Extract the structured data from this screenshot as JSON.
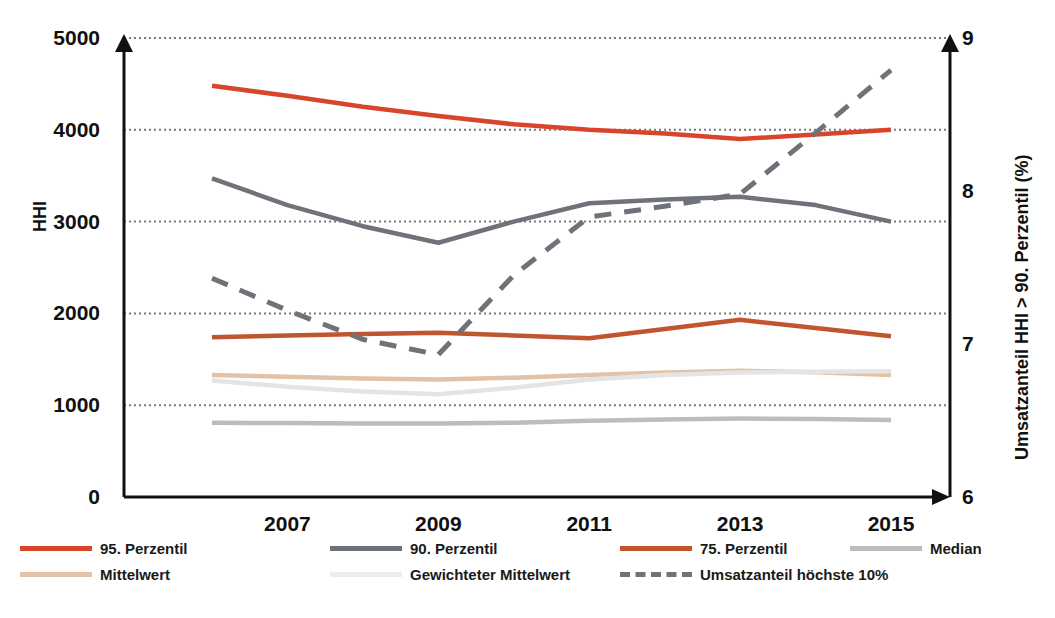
{
  "chart_data": {
    "type": "line",
    "title": "",
    "xlabel": "",
    "ylabel": "HHI",
    "y2label": "Umsatzanteil HHI > 90. Perzentil (%)",
    "grid": true,
    "legend_position": "bottom",
    "x": [
      2006,
      2007,
      2008,
      2009,
      2010,
      2011,
      2012,
      2013,
      2014,
      2015
    ],
    "xticks": [
      "2007",
      "2009",
      "2011",
      "2013",
      "2015"
    ],
    "xtick_values": [
      2007,
      2009,
      2011,
      2013,
      2015
    ],
    "yticks": [
      "0",
      "1000",
      "2000",
      "3000",
      "4000",
      "5000"
    ],
    "ytick_values": [
      0,
      1000,
      2000,
      3000,
      4000,
      5000
    ],
    "ylim": [
      0,
      5000
    ],
    "y2ticks": [
      "6",
      "7",
      "8",
      "9"
    ],
    "y2tick_values": [
      6,
      7,
      8,
      9
    ],
    "y2lim": [
      6,
      9
    ],
    "series": [
      {
        "name": "95. Perzentil",
        "color": "#D9452B",
        "axis": "left",
        "style": "solid",
        "values": [
          4480,
          4370,
          4250,
          4150,
          4060,
          4000,
          3960,
          3900,
          3950,
          4000
        ]
      },
      {
        "name": "90. Perzentil",
        "color": "#6E7379",
        "axis": "left",
        "style": "solid",
        "values": [
          3470,
          3180,
          2950,
          2770,
          3000,
          3200,
          3240,
          3270,
          3180,
          3000
        ]
      },
      {
        "name": "75. Perzentil",
        "color": "#C0552F",
        "axis": "left",
        "style": "solid",
        "values": [
          1740,
          1760,
          1775,
          1790,
          1760,
          1730,
          1830,
          1930,
          1840,
          1750
        ]
      },
      {
        "name": "Median",
        "color": "#BCBCBC",
        "axis": "left",
        "style": "solid",
        "values": [
          810,
          805,
          800,
          800,
          810,
          830,
          845,
          855,
          850,
          840
        ]
      },
      {
        "name": "Mittelwert",
        "color": "#E3C3A8",
        "axis": "left",
        "style": "solid",
        "values": [
          1330,
          1310,
          1290,
          1280,
          1300,
          1330,
          1355,
          1375,
          1360,
          1330
        ]
      },
      {
        "name": "Gewichteter Mittelwert",
        "color": "#E4E4E4",
        "axis": "left",
        "style": "solid",
        "values": [
          1270,
          1200,
          1150,
          1120,
          1190,
          1280,
          1330,
          1355,
          1365,
          1370
        ]
      },
      {
        "name": "Umsatzanteil höchste 10%",
        "color": "#6E7379",
        "axis": "right",
        "style": "dashed",
        "values": [
          7.43,
          7.22,
          7.03,
          6.93,
          7.45,
          7.83,
          7.9,
          7.98,
          8.38,
          8.79
        ]
      }
    ]
  },
  "legend": {
    "rows": [
      [
        {
          "label": "95. Perzentil",
          "color": "#D9452B",
          "style": "solid"
        },
        {
          "label": "90. Perzentil",
          "color": "#6E7379",
          "style": "solid"
        },
        {
          "label": "75. Perzentil",
          "color": "#C0552F",
          "style": "solid"
        },
        {
          "label": "Median",
          "color": "#BCBCBC",
          "style": "solid"
        }
      ],
      [
        {
          "label": "Mittelwert",
          "color": "#E3C3A8",
          "style": "solid"
        },
        {
          "label": "Gewichteter Mittelwert",
          "color": "#EDEDED",
          "style": "solid"
        },
        {
          "label": "Umsatzanteil höchste 10%",
          "color": "#6E7379",
          "style": "dashed"
        }
      ]
    ]
  },
  "colors": {
    "axis": "#111111",
    "grid": "#7a7a7a",
    "background": "#FFFFFF"
  }
}
